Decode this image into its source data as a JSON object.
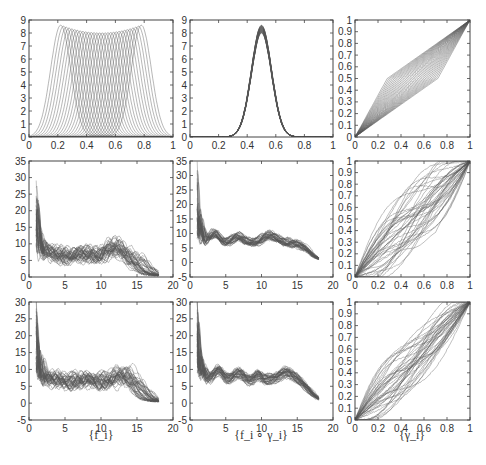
{
  "figure": {
    "width": 486,
    "height": 465,
    "line_color": "#555555",
    "axis_color": "#444444",
    "tick_font_size": 10
  },
  "xlabels": [
    "{f_i}",
    "{f_i ∘ γ_i}",
    "{γ_i}"
  ],
  "chart_data": [
    {
      "id": "r1c1",
      "type": "line",
      "title": "",
      "description": "Family of shifted bump functions (peaks ~8.5 at edges, ~8 in middle) centered from 0.2 to 0.8",
      "box": [
        29,
        20,
        173,
        137
      ],
      "xlim": [
        0,
        1
      ],
      "ylim": [
        0,
        9
      ],
      "xticks": [
        0,
        0.2,
        0.4,
        0.6,
        0.8,
        1
      ],
      "xtick_labels": [
        "0",
        "0.2",
        "0.4",
        "0.6",
        "0.8",
        "1"
      ],
      "yticks": [
        0,
        1,
        2,
        3,
        4,
        5,
        6,
        7,
        8,
        9
      ],
      "ytick_labels": [
        "0",
        "1",
        "2",
        "3",
        "4",
        "5",
        "6",
        "7",
        "8",
        "9"
      ],
      "series_family": {
        "kind": "shifted_bumps",
        "count": 30,
        "center_range": [
          0.22,
          0.78
        ],
        "width": 0.07,
        "peak_edge": 8.6,
        "peak_mid": 8.0
      }
    },
    {
      "id": "r1c2",
      "type": "line",
      "title": "",
      "description": "Aligned bumps all centered at 0.5, peak ~8.5",
      "box": [
        190,
        20,
        333,
        137
      ],
      "xlim": [
        0,
        1
      ],
      "ylim": [
        0,
        9
      ],
      "xticks": [
        0,
        0.2,
        0.4,
        0.6,
        0.8,
        1
      ],
      "xtick_labels": [
        "0",
        "0.2",
        "0.4",
        "0.6",
        "0.8",
        "1"
      ],
      "yticks": [
        0,
        1,
        2,
        3,
        4,
        5,
        6,
        7,
        8,
        9
      ],
      "ytick_labels": [
        "0",
        "1",
        "2",
        "3",
        "4",
        "5",
        "6",
        "7",
        "8",
        "9"
      ],
      "series_family": {
        "kind": "aligned_bumps",
        "count": 30,
        "center": 0.5,
        "width": 0.07,
        "peak_range": [
          8.0,
          8.6
        ]
      }
    },
    {
      "id": "r1c3",
      "type": "line",
      "title": "",
      "description": "Piecewise-linear warping functions gamma from (0,0) to (1,1)",
      "box": [
        355,
        20,
        470,
        137
      ],
      "xlim": [
        0,
        1
      ],
      "ylim": [
        0,
        1
      ],
      "xticks": [
        0,
        0.2,
        0.4,
        0.6,
        0.8,
        1
      ],
      "xtick_labels": [
        "0",
        "0.2",
        "0.4",
        "0.6",
        "0.8",
        "1"
      ],
      "yticks": [
        0,
        0.1,
        0.2,
        0.3,
        0.4,
        0.5,
        0.6,
        0.7,
        0.8,
        0.9,
        1
      ],
      "ytick_labels": [
        "0",
        "0.1",
        "0.2",
        "0.3",
        "0.4",
        "0.5",
        "0.6",
        "0.7",
        "0.8",
        "0.9",
        "1"
      ],
      "series_family": {
        "kind": "warps_linear",
        "count": 30,
        "knot_x_range": [
          0.28,
          0.72
        ],
        "knot_y": 0.5
      }
    },
    {
      "id": "r2c1",
      "type": "line",
      "title": "",
      "description": "Noisy spectral-like curves: spike ~20-30 near x=1, plateau ~7, hump ~8 near 12, decaying to ~0 at 18",
      "box": [
        29,
        161,
        173,
        277
      ],
      "xlim": [
        0,
        20
      ],
      "ylim": [
        0,
        35
      ],
      "xticks": [
        0,
        5,
        10,
        15,
        20
      ],
      "xtick_labels": [
        "0",
        "5",
        "10",
        "15",
        "20"
      ],
      "yticks": [
        0,
        5,
        10,
        15,
        20,
        25,
        30,
        35
      ],
      "ytick_labels": [
        "0",
        "5",
        "10",
        "15",
        "20",
        "25",
        "30",
        "35"
      ],
      "series_family": {
        "kind": "signals",
        "count": 40,
        "seed": 3,
        "hump_center": 12,
        "hump_jitter": 1.2,
        "spike_max": 30
      }
    },
    {
      "id": "r2c2",
      "type": "line",
      "title": "",
      "description": "Aligned signals: spike near 1, bumps at ~3.5, ~6.5, ~11, decaying to ~0 by 17",
      "box": [
        190,
        161,
        333,
        277
      ],
      "xlim": [
        0,
        20
      ],
      "ylim": [
        -5,
        35
      ],
      "xticks": [
        0,
        5,
        10,
        15,
        20
      ],
      "xtick_labels": [
        "0",
        "5",
        "10",
        "15",
        "20"
      ],
      "yticks": [
        -5,
        0,
        5,
        10,
        15,
        20,
        25,
        30,
        35
      ],
      "ytick_labels": [
        "-5",
        "0",
        "5",
        "10",
        "15",
        "20",
        "25",
        "30",
        "35"
      ],
      "series_family": {
        "kind": "aligned_signals",
        "count": 40,
        "seed": 7,
        "hump_center": 11.2,
        "hump_jitter": 0.2,
        "spike_max": 30
      }
    },
    {
      "id": "r2c3",
      "type": "line",
      "title": "",
      "description": "Estimated warping functions near identity with spread",
      "box": [
        355,
        161,
        470,
        277
      ],
      "xlim": [
        0,
        1
      ],
      "ylim": [
        0,
        1
      ],
      "xticks": [
        0,
        0.2,
        0.4,
        0.6,
        0.8,
        1
      ],
      "xtick_labels": [
        "0",
        "0.2",
        "0.4",
        "0.6",
        "0.8",
        "1"
      ],
      "yticks": [
        0,
        0.1,
        0.2,
        0.3,
        0.4,
        0.5,
        0.6,
        0.7,
        0.8,
        0.9,
        1
      ],
      "ytick_labels": [
        "0",
        "0.1",
        "0.2",
        "0.3",
        "0.4",
        "0.5",
        "0.6",
        "0.7",
        "0.8",
        "0.9",
        "1"
      ],
      "series_family": {
        "kind": "warps_smooth",
        "count": 40,
        "seed": 11,
        "spread": 0.12
      }
    },
    {
      "id": "r3c1",
      "type": "line",
      "title": "",
      "description": "Noisy signals: spike ~25 near 1, plateau ~7, hump ~9 around 13-15, decaying to ~0 at 18",
      "box": [
        29,
        302,
        173,
        420
      ],
      "xlim": [
        0,
        20
      ],
      "ylim": [
        -5,
        30
      ],
      "xticks": [
        0,
        5,
        10,
        15,
        20
      ],
      "xtick_labels": [
        "0",
        "5",
        "10",
        "15",
        "20"
      ],
      "yticks": [
        -5,
        0,
        5,
        10,
        15,
        20,
        25,
        30
      ],
      "ytick_labels": [
        "-5",
        "0",
        "5",
        "10",
        "15",
        "20",
        "25",
        "30"
      ],
      "series_family": {
        "kind": "signals",
        "count": 40,
        "seed": 21,
        "hump_center": 14,
        "hump_jitter": 1.4,
        "spike_max": 26
      }
    },
    {
      "id": "r3c2",
      "type": "line",
      "title": "",
      "description": "Aligned signals with bumps at ~4, ~6.8, ~9.5, ~13.5 (peak ~10), decaying to ~0 by 17",
      "box": [
        190,
        302,
        333,
        420
      ],
      "xlim": [
        0,
        20
      ],
      "ylim": [
        -5,
        30
      ],
      "xticks": [
        0,
        5,
        10,
        15,
        20
      ],
      "xtick_labels": [
        "0",
        "5",
        "10",
        "15",
        "20"
      ],
      "yticks": [
        -5,
        0,
        5,
        10,
        15,
        20,
        25,
        30
      ],
      "ytick_labels": [
        "-5",
        "0",
        "5",
        "10",
        "15",
        "20",
        "25",
        "30"
      ],
      "series_family": {
        "kind": "aligned_signals",
        "count": 40,
        "seed": 33,
        "hump_center": 13.5,
        "hump_jitter": 0.2,
        "spike_max": 26
      }
    },
    {
      "id": "r3c3",
      "type": "line",
      "title": "",
      "description": "Estimated warping functions near identity",
      "box": [
        355,
        302,
        470,
        420
      ],
      "xlim": [
        0,
        1
      ],
      "ylim": [
        0,
        1
      ],
      "xticks": [
        0,
        0.2,
        0.4,
        0.6,
        0.8,
        1
      ],
      "xtick_labels": [
        "0",
        "0.2",
        "0.4",
        "0.6",
        "0.8",
        "1"
      ],
      "yticks": [
        0,
        0.1,
        0.2,
        0.3,
        0.4,
        0.5,
        0.6,
        0.7,
        0.8,
        0.9,
        1
      ],
      "ytick_labels": [
        "0",
        "0.1",
        "0.2",
        "0.3",
        "0.4",
        "0.5",
        "0.6",
        "0.7",
        "0.8",
        "0.9",
        "1"
      ],
      "series_family": {
        "kind": "warps_smooth",
        "count": 40,
        "seed": 45,
        "spread": 0.1
      }
    }
  ]
}
